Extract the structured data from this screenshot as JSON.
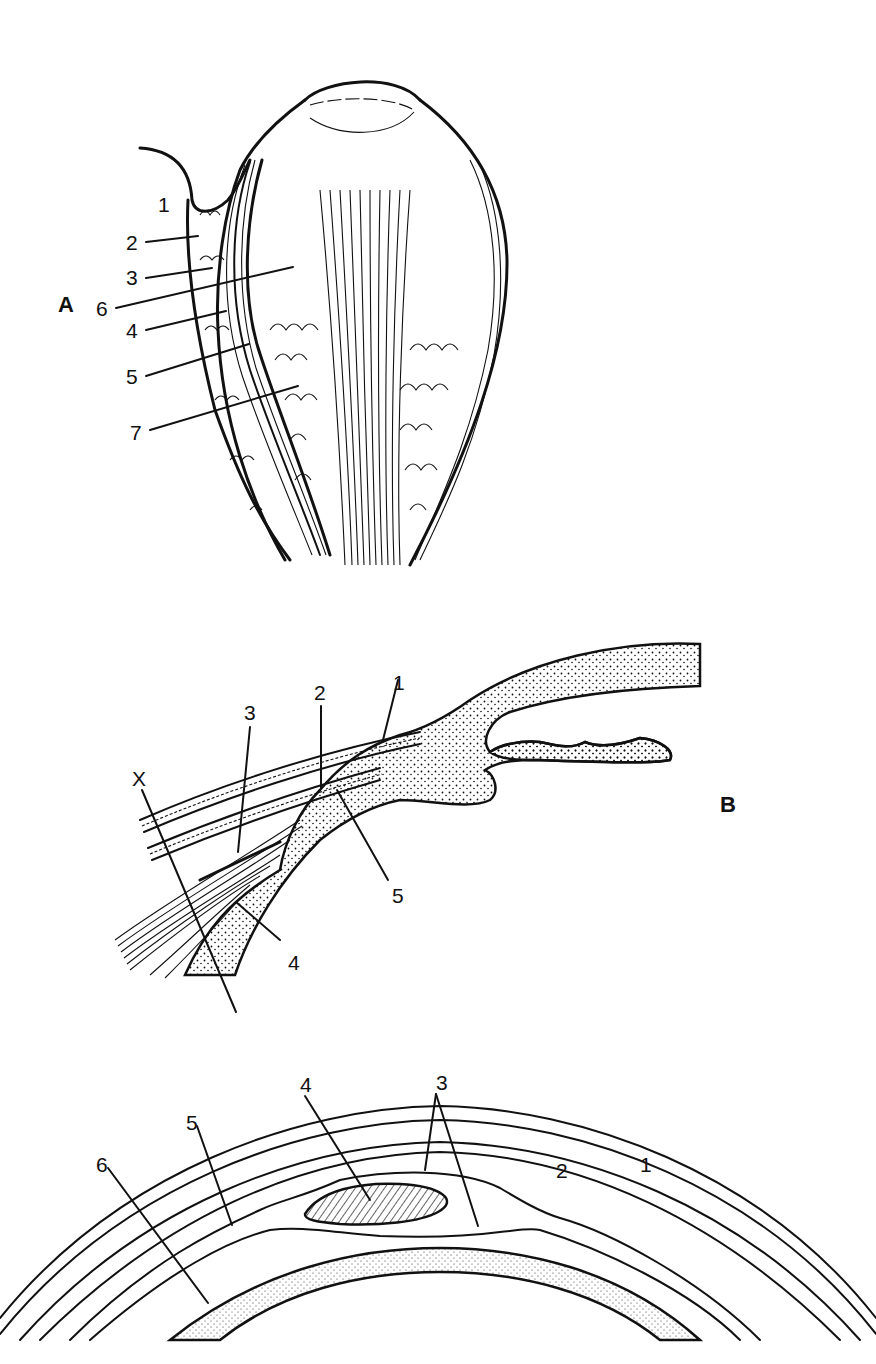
{
  "figure": {
    "colors": {
      "ink": "#111111",
      "background": "#ffffff"
    }
  },
  "panel_a": {
    "letter": "A",
    "labels": [
      "1",
      "2",
      "3",
      "4",
      "5",
      "6",
      "7"
    ]
  },
  "panel_b": {
    "letter": "B",
    "marker": "X",
    "labels": [
      "1",
      "2",
      "3",
      "4",
      "5"
    ]
  },
  "panel_c": {
    "labels": [
      "1",
      "2",
      "3",
      "4",
      "5",
      "6"
    ]
  }
}
